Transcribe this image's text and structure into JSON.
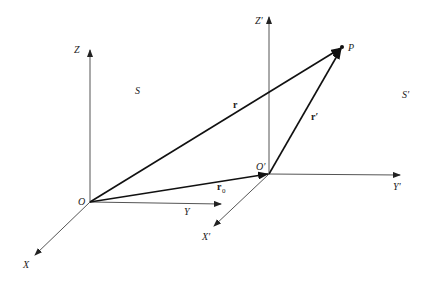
{
  "diagram": {
    "frames": {
      "S": {
        "label": "S",
        "origin_label": "O",
        "x_label": "X",
        "y_label": "Y",
        "z_label": "Z"
      },
      "S_prime": {
        "label": "S′",
        "origin_label": "O′",
        "x_label": "X′",
        "y_label": "Y′",
        "z_label": "Z′"
      }
    },
    "point_label": "P",
    "vectors": {
      "r": "r",
      "r_prime": "r′",
      "r0_base": "r",
      "r0_sub": "0"
    },
    "colors": {
      "axis": "#555555",
      "vector": "#111111",
      "text": "#222222"
    }
  }
}
